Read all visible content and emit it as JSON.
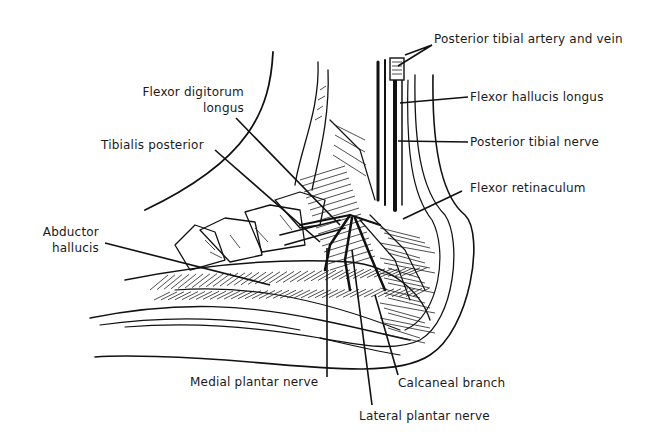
{
  "figure": {
    "ink_color": "#111111",
    "background": "#ffffff"
  },
  "labels": {
    "posterior_tibial_artery_vein": "Posterior tibial artery and vein",
    "flexor_hallucis_longus": "Flexor hallucis longus",
    "posterior_tibial_nerve": "Posterior tibial nerve",
    "flexor_retinaculum": "Flexor retinaculum",
    "flexor_digitorum_longus_line1": "Flexor digitorum",
    "flexor_digitorum_longus_line2": "longus",
    "tibialis_posterior": "Tibialis posterior",
    "abductor_hallucis_line1": "Abductor",
    "abductor_hallucis_line2": "hallucis",
    "medial_plantar_nerve": "Medial plantar nerve",
    "calcaneal_branch": "Calcaneal branch",
    "lateral_plantar_nerve": "Lateral plantar nerve"
  }
}
